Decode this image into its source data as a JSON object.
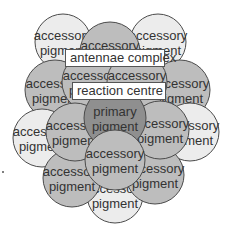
{
  "diagram": {
    "colors": {
      "light_fill": "#ececec",
      "mid_fill": "#bdbdbd",
      "dark_fill": "#8f8f8f",
      "stroke": "#4a4a4a",
      "label_bg": "#ffffff"
    },
    "labels": {
      "antennae": "antennae complex",
      "reaction": "reaction centre"
    },
    "circles": [
      {
        "id": "c1",
        "cx": 63,
        "cy": 42,
        "r": 28,
        "shade": "light",
        "line1": "accessory",
        "line2": "pigment"
      },
      {
        "id": "c2",
        "cx": 158,
        "cy": 42,
        "r": 28,
        "shade": "light",
        "line1": "accessory",
        "line2": "pigment"
      },
      {
        "id": "c4",
        "cx": 55,
        "cy": 90,
        "r": 30,
        "shade": "mid",
        "line1": "accessory",
        "line2": "pigment"
      },
      {
        "id": "c5",
        "cx": 180,
        "cy": 90,
        "r": 30,
        "shade": "mid",
        "line1": "accessory",
        "line2": "pigment"
      },
      {
        "id": "c8",
        "cx": 42,
        "cy": 138,
        "r": 29,
        "shade": "light",
        "line1": "accessory",
        "line2": "pigment"
      },
      {
        "id": "c9",
        "cx": 190,
        "cy": 132,
        "r": 29,
        "shade": "light",
        "line1": "accessory",
        "line2": "pigment"
      },
      {
        "id": "c16",
        "cx": 115,
        "cy": 195,
        "r": 28,
        "shade": "light",
        "line1": "accessory",
        "line2": "pigment"
      },
      {
        "id": "c14",
        "cx": 72,
        "cy": 178,
        "r": 29,
        "shade": "mid",
        "line1": "accessory",
        "line2": "pigment"
      },
      {
        "id": "c15",
        "cx": 155,
        "cy": 175,
        "r": 29,
        "shade": "mid",
        "line1": "accessory",
        "line2": "pigment"
      },
      {
        "id": "c3",
        "cx": 110,
        "cy": 52,
        "r": 30,
        "shade": "mid",
        "line1": "accessory",
        "line2": "pigment"
      },
      {
        "id": "c6",
        "cx": 92,
        "cy": 82,
        "r": 30,
        "shade": "mid",
        "line1": "accessory",
        "line2": "pigment"
      },
      {
        "id": "c7",
        "cx": 137,
        "cy": 82,
        "r": 30,
        "shade": "mid",
        "line1": "accessory",
        "line2": "pigment"
      },
      {
        "id": "c11",
        "cx": 75,
        "cy": 132,
        "r": 29,
        "shade": "mid",
        "line1": "accessory",
        "line2": "pigment"
      },
      {
        "id": "c12",
        "cx": 160,
        "cy": 130,
        "r": 29,
        "shade": "mid",
        "line1": "accessory",
        "line2": "pigment"
      },
      {
        "id": "c10",
        "cx": 115,
        "cy": 118,
        "r": 31,
        "shade": "dark",
        "line1": "primary",
        "line2": "pigment"
      },
      {
        "id": "c13",
        "cx": 115,
        "cy": 160,
        "r": 30,
        "shade": "mid",
        "line1": "accessory",
        "line2": "pigment"
      }
    ]
  }
}
